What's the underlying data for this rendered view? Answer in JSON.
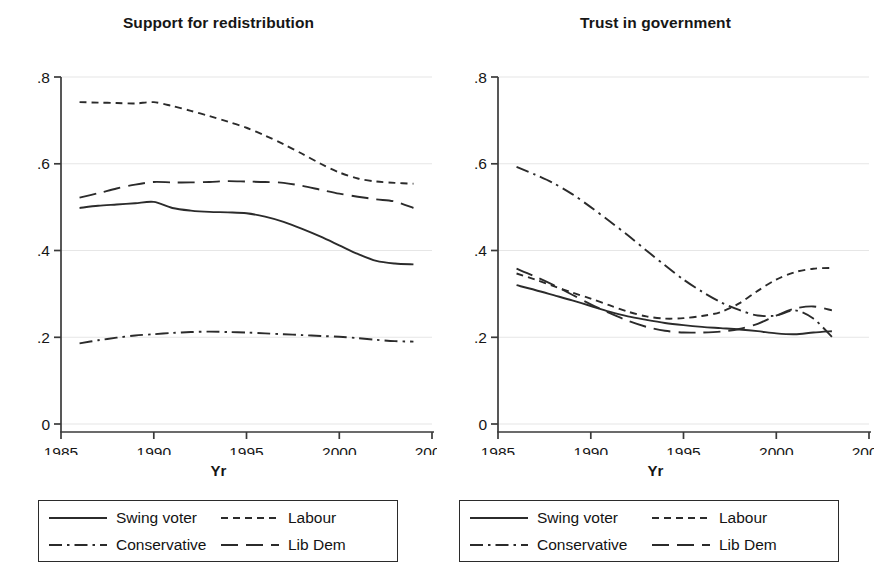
{
  "figure": {
    "background": "#ffffff",
    "line_color": "#2b2b2b",
    "grid_color": "#e6e6e6",
    "axis_color": "#3a3a3a"
  },
  "panels": [
    {
      "key": "support_for_redistribution",
      "title": "Support for redistribution",
      "xlabel": "Yr"
    },
    {
      "key": "trust_in_government",
      "title": "Trust in government",
      "xlabel": "Yr"
    }
  ],
  "legend": {
    "items": [
      {
        "label": "Swing voter",
        "style": "solid",
        "icon": "solid-line-icon"
      },
      {
        "label": "Labour",
        "style": "dash",
        "icon": "short-dashed-line-icon"
      },
      {
        "label": "Conservative",
        "style": "dashdot",
        "icon": "dash-dot-line-icon"
      },
      {
        "label": "Lib Dem",
        "style": "longdash",
        "icon": "long-dashed-line-icon"
      }
    ]
  },
  "chart_data": [
    {
      "type": "line",
      "title": "Support for redistribution",
      "xlabel": "Yr",
      "ylabel": "",
      "xlim": [
        1985,
        2005
      ],
      "ylim": [
        0,
        0.8
      ],
      "xticks": [
        1985,
        1990,
        1995,
        2000,
        2005
      ],
      "xticklabels": [
        "1985",
        "1990",
        "1995",
        "2000",
        "2005"
      ],
      "yticks": [
        0,
        0.2,
        0.4,
        0.6,
        0.8
      ],
      "yticklabels": [
        "0",
        ".2",
        ".4",
        ".6",
        ".8"
      ],
      "grid": true,
      "grid_axis": "y",
      "legend_position": "below",
      "series": [
        {
          "name": "Swing voter",
          "style": "solid",
          "x": [
            1986,
            1987,
            1988,
            1989,
            1990,
            1991,
            1992,
            1993,
            1994,
            1995,
            1996,
            1997,
            1998,
            1999,
            2000,
            2001,
            2002,
            2003,
            2004
          ],
          "values": [
            0.498,
            0.503,
            0.506,
            0.509,
            0.512,
            0.498,
            0.492,
            0.489,
            0.488,
            0.486,
            0.478,
            0.466,
            0.45,
            0.432,
            0.412,
            0.392,
            0.376,
            0.37,
            0.368
          ]
        },
        {
          "name": "Labour",
          "style": "dash",
          "x": [
            1986,
            1987,
            1988,
            1989,
            1990,
            1991,
            1992,
            1993,
            1994,
            1995,
            1996,
            1997,
            1998,
            1999,
            2000,
            2001,
            2002,
            2003,
            2004
          ],
          "values": [
            0.742,
            0.741,
            0.74,
            0.739,
            0.742,
            0.733,
            0.722,
            0.71,
            0.697,
            0.683,
            0.665,
            0.645,
            0.623,
            0.6,
            0.58,
            0.566,
            0.559,
            0.556,
            0.554
          ]
        },
        {
          "name": "Conservative",
          "style": "dashdot",
          "x": [
            1986,
            1987,
            1988,
            1989,
            1990,
            1991,
            1992,
            1993,
            1994,
            1995,
            1996,
            1997,
            1998,
            1999,
            2000,
            2001,
            2002,
            2003,
            2004
          ],
          "values": [
            0.186,
            0.193,
            0.199,
            0.204,
            0.207,
            0.21,
            0.212,
            0.213,
            0.212,
            0.211,
            0.209,
            0.207,
            0.205,
            0.203,
            0.201,
            0.198,
            0.194,
            0.191,
            0.19
          ]
        },
        {
          "name": "Lib Dem",
          "style": "longdash",
          "x": [
            1986,
            1987,
            1988,
            1989,
            1990,
            1991,
            1992,
            1993,
            1994,
            1995,
            1996,
            1997,
            1998,
            1999,
            2000,
            2001,
            2002,
            2003,
            2004
          ],
          "values": [
            0.522,
            0.532,
            0.543,
            0.552,
            0.558,
            0.557,
            0.557,
            0.558,
            0.56,
            0.559,
            0.558,
            0.556,
            0.549,
            0.54,
            0.531,
            0.524,
            0.518,
            0.513,
            0.498
          ]
        }
      ]
    },
    {
      "type": "line",
      "title": "Trust in government",
      "xlabel": "Yr",
      "ylabel": "",
      "xlim": [
        1985,
        2005
      ],
      "ylim": [
        0,
        0.8
      ],
      "xticks": [
        1985,
        1990,
        1995,
        2000,
        2005
      ],
      "xticklabels": [
        "1985",
        "1990",
        "1995",
        "2000",
        "2005"
      ],
      "yticks": [
        0,
        0.2,
        0.4,
        0.6,
        0.8
      ],
      "yticklabels": [
        "0",
        ".2",
        ".4",
        ".6",
        ".8"
      ],
      "grid": true,
      "grid_axis": "y",
      "legend_position": "below",
      "series": [
        {
          "name": "Swing voter",
          "style": "solid",
          "x": [
            1986,
            1987,
            1988,
            1989,
            1990,
            1991,
            1992,
            1993,
            1994,
            1995,
            1996,
            1997,
            1998,
            1999,
            2000,
            2001,
            2002,
            2003
          ],
          "values": [
            0.32,
            0.309,
            0.297,
            0.285,
            0.272,
            0.259,
            0.248,
            0.24,
            0.233,
            0.228,
            0.224,
            0.221,
            0.218,
            0.214,
            0.209,
            0.207,
            0.211,
            0.214
          ]
        },
        {
          "name": "Labour",
          "style": "dash",
          "x": [
            1986,
            1987,
            1988,
            1989,
            1990,
            1991,
            1992,
            1993,
            1994,
            1995,
            1996,
            1997,
            1998,
            1999,
            2000,
            2001,
            2002,
            2003
          ],
          "values": [
            0.347,
            0.333,
            0.318,
            0.303,
            0.289,
            0.274,
            0.259,
            0.248,
            0.243,
            0.244,
            0.249,
            0.258,
            0.278,
            0.307,
            0.333,
            0.35,
            0.358,
            0.36
          ]
        },
        {
          "name": "Conservative",
          "style": "dashdot",
          "x": [
            1986,
            1987,
            1988,
            1989,
            1990,
            1991,
            1992,
            1993,
            1994,
            1995,
            1996,
            1997,
            1998,
            1999,
            2000,
            2001,
            2002,
            2003
          ],
          "values": [
            0.593,
            0.575,
            0.555,
            0.53,
            0.5,
            0.468,
            0.435,
            0.4,
            0.366,
            0.333,
            0.305,
            0.281,
            0.263,
            0.25,
            0.25,
            0.262,
            0.243,
            0.201
          ]
        },
        {
          "name": "Lib Dem",
          "style": "longdash",
          "x": [
            1986,
            1987,
            1988,
            1989,
            1990,
            1991,
            1992,
            1993,
            1994,
            1995,
            1996,
            1997,
            1998,
            1999,
            2000,
            2001,
            2002,
            2003
          ],
          "values": [
            0.358,
            0.34,
            0.32,
            0.298,
            0.276,
            0.256,
            0.238,
            0.224,
            0.215,
            0.211,
            0.211,
            0.213,
            0.219,
            0.231,
            0.25,
            0.266,
            0.271,
            0.262
          ]
        }
      ]
    }
  ]
}
